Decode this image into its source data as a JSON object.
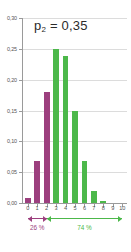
{
  "chart_data": {
    "type": "bar",
    "title_base": "p",
    "title_sub": "2",
    "title_rest": " = 0,35",
    "xlabel": "",
    "ylabel": "",
    "grid": true,
    "legend": "none",
    "xlim": [
      -0.5,
      10.5
    ],
    "ylim": [
      0.0,
      0.3
    ],
    "categories": [
      "0",
      "1",
      "2",
      "3",
      "4",
      "5",
      "6",
      "7",
      "8",
      "9",
      "10"
    ],
    "values": [
      0.008,
      0.068,
      0.18,
      0.25,
      0.238,
      0.15,
      0.068,
      0.02,
      0.003,
      0.0,
      0.0
    ],
    "bar_colors": [
      "#9c3f7e",
      "#9c3f7e",
      "#9c3f7e",
      "#4cb84a",
      "#4cb84a",
      "#4cb84a",
      "#4cb84a",
      "#4cb84a",
      "#4cb84a",
      "#4cb84a",
      "#4cb84a"
    ],
    "yticks": [
      0.0,
      0.05,
      0.1,
      0.15,
      0.2,
      0.25,
      0.3
    ],
    "ytick_labels": [
      "0,00",
      "0,05",
      "0,10",
      "0,15",
      "0,20",
      "0,25",
      "0,30"
    ],
    "xticks": [
      0,
      1,
      2,
      3,
      4,
      5,
      6,
      7,
      8,
      9,
      10
    ],
    "xtick_labels": [
      "0",
      "1",
      "2",
      "3",
      "4",
      "5",
      "6",
      "7",
      "8",
      "9",
      "10"
    ],
    "annotations": [
      {
        "name": "lower-tail-span",
        "label": "26 %",
        "color": "#9c3f7e",
        "from_category": 0,
        "to_category": 2
      },
      {
        "name": "upper-tail-span",
        "label": "74 %",
        "color": "#4cb84a",
        "from_category": 2,
        "to_category": 10
      }
    ],
    "colors": {
      "purple": "#9c3f7e",
      "green": "#4cb84a",
      "axis": "#9a9a9a",
      "grid": "#dcdcdc",
      "text": "#555555",
      "title_text": "#2b2b2b",
      "background": "#ffffff"
    }
  }
}
